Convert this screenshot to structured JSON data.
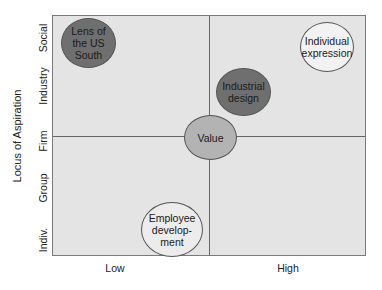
{
  "diagram": {
    "y_axis_title": "Locus of Aspiration",
    "y_ticks": [
      "Social",
      "Industry",
      "Firm",
      "Group",
      "Indiv."
    ],
    "x_ticks": [
      "Low",
      "High"
    ],
    "colors": {
      "plot_background": "#e4e4e4",
      "dark_ellipse": "#6f6f6f",
      "medium_ellipse": "#b3b3b3",
      "light_ellipse": "#f2f2f2",
      "border": "#7a7a7a"
    },
    "items": [
      {
        "id": "lens",
        "lines": [
          "Lens of",
          "the US",
          "South"
        ],
        "shade": "dark"
      },
      {
        "id": "individual",
        "lines": [
          "Individual",
          "expression"
        ],
        "shade": "light"
      },
      {
        "id": "industrial",
        "lines": [
          "Industrial",
          "design"
        ],
        "shade": "dark"
      },
      {
        "id": "value",
        "lines": [
          "Value"
        ],
        "shade": "medium"
      },
      {
        "id": "employee",
        "lines": [
          "Employee",
          "develop-",
          "ment"
        ],
        "shade": "light"
      }
    ]
  }
}
